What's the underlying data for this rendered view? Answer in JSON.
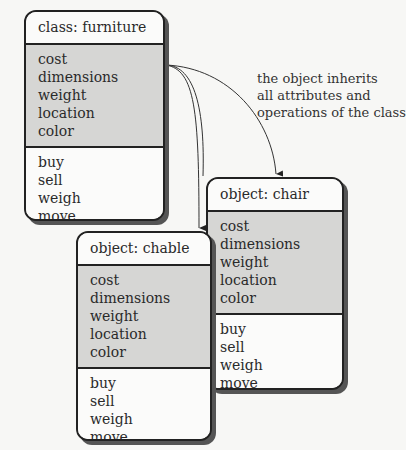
{
  "diagram": {
    "class_box": {
      "title": "class: furniture",
      "attributes": [
        "cost",
        "dimensions",
        "weight",
        "location",
        "color"
      ],
      "operations": [
        "buy",
        "sell",
        "weigh",
        "move"
      ]
    },
    "object_chair": {
      "title": "object: chair",
      "attributes": [
        "cost",
        "dimensions",
        "weight",
        "location",
        "color"
      ],
      "operations": [
        "buy",
        "sell",
        "weigh",
        "move"
      ]
    },
    "object_chable": {
      "title": "object: chable",
      "attributes": [
        "cost",
        "dimensions",
        "weight",
        "location",
        "color"
      ],
      "operations": [
        "buy",
        "sell",
        "weigh",
        "move"
      ]
    },
    "annotation": {
      "lines": [
        "the object inherits",
        "all attributes and",
        "operations of the class"
      ]
    },
    "colors": {
      "attribute_fill": "#d6d6d4",
      "box_fill": "#fbfbfa",
      "border": "#222222",
      "shadow": "#555555"
    }
  }
}
